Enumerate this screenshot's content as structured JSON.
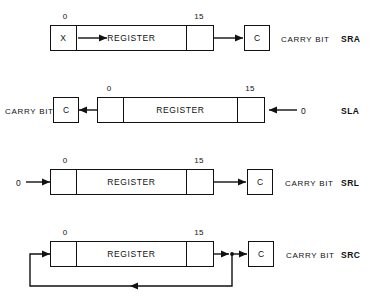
{
  "diagram": {
    "bit_labels": {
      "low": "0",
      "high": "15"
    },
    "register_label": "REGISTER",
    "carry_box_label": "C",
    "carry_text": "CARRY BIT",
    "sign_cell_label": "X",
    "zero_input_label": "0",
    "rows": [
      {
        "opcode": "SRA",
        "name": "shift-right-arithmetic",
        "bit0_label": "0",
        "bit15_label": "15",
        "register_label": "REGISTER",
        "left_cell_text": "X",
        "right_cell_text": "",
        "carry_box_label": "C",
        "carry_text": "CARRY BIT",
        "direction": "right",
        "input_label": "",
        "feedback": "false"
      },
      {
        "opcode": "SLA",
        "name": "shift-left-arithmetic",
        "bit0_label": "0",
        "bit15_label": "15",
        "register_label": "REGISTER",
        "left_cell_text": "",
        "right_cell_text": "",
        "carry_box_label": "C",
        "carry_text": "CARRY BIT",
        "direction": "left",
        "input_label": "0",
        "feedback": "false"
      },
      {
        "opcode": "SRL",
        "name": "shift-right-logical",
        "bit0_label": "0",
        "bit15_label": "15",
        "register_label": "REGISTER",
        "left_cell_text": "",
        "right_cell_text": "",
        "carry_box_label": "C",
        "carry_text": "CARRY BIT",
        "direction": "right",
        "input_label": "0",
        "feedback": "false"
      },
      {
        "opcode": "SRC",
        "name": "shift-right-circular",
        "bit0_label": "0",
        "bit15_label": "15",
        "register_label": "REGISTER",
        "left_cell_text": "",
        "right_cell_text": "",
        "carry_box_label": "C",
        "carry_text": "CARRY BIT",
        "direction": "right",
        "input_label": "",
        "feedback": "true"
      }
    ],
    "colors": {
      "line": "#111111",
      "background": "#ffffff",
      "text": "#111111"
    }
  }
}
